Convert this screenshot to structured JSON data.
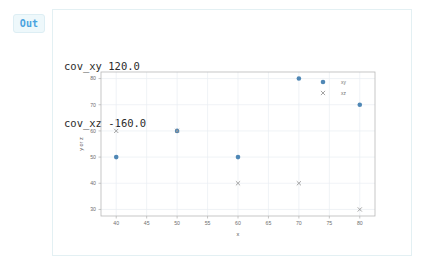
{
  "cell": {
    "prompt_label": "Out"
  },
  "text_output": {
    "line1": "cov_xy 120.0",
    "line2": "cov_xz -160.0"
  },
  "chart_data": {
    "type": "scatter",
    "title": "",
    "xlabel": "x",
    "ylabel": "y or z",
    "xlim": [
      37.5,
      82.5
    ],
    "ylim": [
      27.5,
      82.5
    ],
    "grid": true,
    "legend_position": "top-right-inside",
    "xticks": [
      40,
      45,
      50,
      55,
      60,
      65,
      70,
      75,
      80
    ],
    "xtick_labels": [
      "40",
      "45",
      "50",
      "55",
      "60",
      "65",
      "70",
      "75",
      "80"
    ],
    "yticks": [
      30,
      40,
      50,
      60,
      70,
      80
    ],
    "ytick_labels": [
      "30",
      "40",
      "50",
      "60",
      "70",
      "80"
    ],
    "series": [
      {
        "name": "xy",
        "marker": "circle",
        "color": "#4f87b5",
        "x": [
          40,
          50,
          60,
          70,
          80
        ],
        "y": [
          50,
          60,
          50,
          80,
          70
        ]
      },
      {
        "name": "xz",
        "marker": "x",
        "color": "#9a9a9a",
        "x": [
          40,
          50,
          60,
          70,
          80
        ],
        "y": [
          60,
          60,
          40,
          40,
          30
        ]
      }
    ]
  },
  "colors": {
    "series_xy": "#4f87b5",
    "series_xz": "#9a9a9a",
    "panel_border": "#e3f0f3",
    "badge_text": "#4aa3df",
    "badge_bg": "#eef8fb"
  }
}
